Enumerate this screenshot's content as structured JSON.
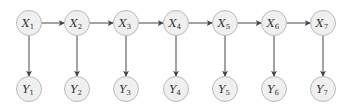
{
  "diagram": {
    "type": "hidden-markov-model",
    "hidden_nodes": [
      {
        "id": "X1",
        "label": "X",
        "sub": "1",
        "cx": 29,
        "cy": 23
      },
      {
        "id": "X2",
        "label": "X",
        "sub": "2",
        "cx": 77,
        "cy": 23
      },
      {
        "id": "X3",
        "label": "X",
        "sub": "3",
        "cx": 126,
        "cy": 23
      },
      {
        "id": "X4",
        "label": "X",
        "sub": "4",
        "cx": 176,
        "cy": 23
      },
      {
        "id": "X5",
        "label": "X",
        "sub": "5",
        "cx": 225,
        "cy": 23
      },
      {
        "id": "X6",
        "label": "X",
        "sub": "6",
        "cx": 274,
        "cy": 23
      },
      {
        "id": "X7",
        "label": "X",
        "sub": "7",
        "cx": 323,
        "cy": 23
      }
    ],
    "observed_nodes": [
      {
        "id": "Y1",
        "label": "Y",
        "sub": "1",
        "cx": 29,
        "cy": 89
      },
      {
        "id": "Y2",
        "label": "Y",
        "sub": "2",
        "cx": 77,
        "cy": 89
      },
      {
        "id": "Y3",
        "label": "Y",
        "sub": "3",
        "cx": 126,
        "cy": 89
      },
      {
        "id": "Y4",
        "label": "Y",
        "sub": "4",
        "cx": 176,
        "cy": 89
      },
      {
        "id": "Y5",
        "label": "Y",
        "sub": "5",
        "cx": 225,
        "cy": 89
      },
      {
        "id": "Y6",
        "label": "Y",
        "sub": "6",
        "cx": 274,
        "cy": 89
      },
      {
        "id": "Y7",
        "label": "Y",
        "sub": "7",
        "cx": 323,
        "cy": 89
      }
    ],
    "edges": [
      [
        "X1",
        "X2"
      ],
      [
        "X2",
        "X3"
      ],
      [
        "X3",
        "X4"
      ],
      [
        "X4",
        "X5"
      ],
      [
        "X5",
        "X6"
      ],
      [
        "X6",
        "X7"
      ],
      [
        "X1",
        "Y1"
      ],
      [
        "X2",
        "Y2"
      ],
      [
        "X3",
        "Y3"
      ],
      [
        "X4",
        "Y4"
      ],
      [
        "X5",
        "Y5"
      ],
      [
        "X6",
        "Y6"
      ],
      [
        "X7",
        "Y7"
      ]
    ],
    "node_radius": 12.5,
    "colors": {
      "node_fill": "#efefef",
      "node_stroke": "#b9b9b9",
      "edge": "#444444",
      "text": "#333333"
    }
  }
}
